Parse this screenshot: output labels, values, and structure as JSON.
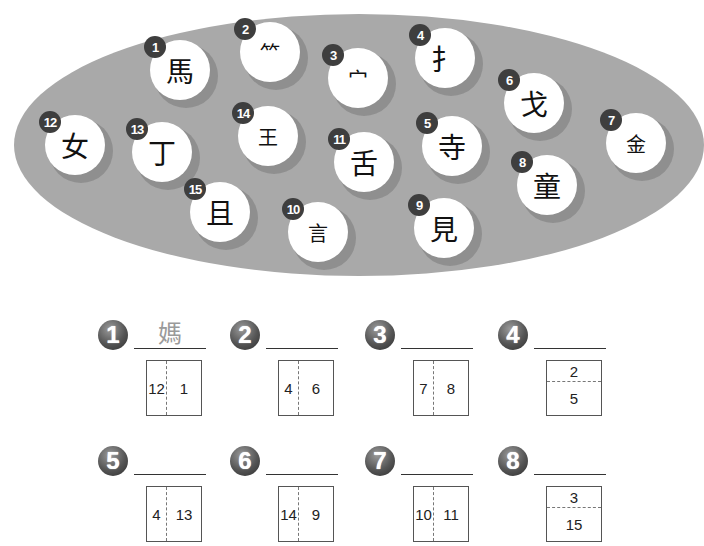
{
  "components": {
    "title": "Character components",
    "items": [
      {
        "n": "1",
        "char": "馬",
        "x": 150,
        "y": 40
      },
      {
        "n": "2",
        "char": "⺮",
        "x": 240,
        "y": 22,
        "small": true
      },
      {
        "n": "3",
        "char": "宀",
        "x": 328,
        "y": 48,
        "small": true
      },
      {
        "n": "4",
        "char": "扌",
        "x": 415,
        "y": 28
      },
      {
        "n": "5",
        "char": "寺",
        "x": 422,
        "y": 116
      },
      {
        "n": "6",
        "char": "戈",
        "x": 504,
        "y": 73
      },
      {
        "n": "7",
        "char": "金",
        "x": 606,
        "y": 113,
        "small": true
      },
      {
        "n": "8",
        "char": "童",
        "x": 517,
        "y": 155
      },
      {
        "n": "9",
        "char": "見",
        "x": 414,
        "y": 198
      },
      {
        "n": "10",
        "char": "言",
        "x": 288,
        "y": 202,
        "small": true
      },
      {
        "n": "11",
        "char": "舌",
        "x": 334,
        "y": 132
      },
      {
        "n": "12",
        "char": "女",
        "x": 45,
        "y": 115
      },
      {
        "n": "13",
        "char": "丁",
        "x": 132,
        "y": 122
      },
      {
        "n": "14",
        "char": "王",
        "x": 238,
        "y": 106,
        "small": true
      },
      {
        "n": "15",
        "char": "且",
        "x": 190,
        "y": 182
      }
    ]
  },
  "exercises": [
    {
      "n": "1",
      "answer": "媽",
      "layout": "lr",
      "parts": [
        "12",
        "1"
      ],
      "x": 98,
      "y": 320
    },
    {
      "n": "2",
      "answer": "",
      "layout": "lr",
      "parts": [
        "4",
        "6"
      ],
      "x": 230,
      "y": 320
    },
    {
      "n": "3",
      "answer": "",
      "layout": "lr",
      "parts": [
        "7",
        "8"
      ],
      "x": 365,
      "y": 320
    },
    {
      "n": "4",
      "answer": "",
      "layout": "tb",
      "parts": [
        "2",
        "5"
      ],
      "x": 498,
      "y": 320
    },
    {
      "n": "5",
      "answer": "",
      "layout": "lr",
      "parts": [
        "4",
        "13"
      ],
      "x": 98,
      "y": 446
    },
    {
      "n": "6",
      "answer": "",
      "layout": "lr",
      "parts": [
        "14",
        "9"
      ],
      "x": 230,
      "y": 446
    },
    {
      "n": "7",
      "answer": "",
      "layout": "lr",
      "parts": [
        "10",
        "11"
      ],
      "x": 365,
      "y": 446
    },
    {
      "n": "8",
      "answer": "",
      "layout": "tb",
      "parts": [
        "3",
        "15"
      ],
      "x": 498,
      "y": 446
    }
  ],
  "colors": {
    "ellipse": "#a9a9a9",
    "ring": "#8f8f8f",
    "badge": "#3e3e3e",
    "answer_hint": "#9a9a9a"
  }
}
